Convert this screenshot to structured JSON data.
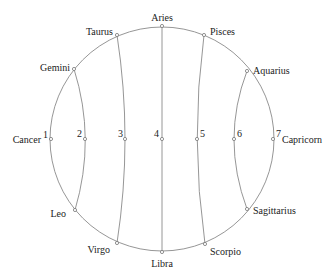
{
  "diagram": {
    "type": "zodiac-circle-arcs",
    "colors": {
      "line": "#8a8a8a",
      "text": "#222222",
      "background": "#ffffff"
    },
    "circle": {
      "cx": 162,
      "cy": 139,
      "r": 113
    },
    "signs": [
      {
        "name": "Aries",
        "x": 162,
        "y": 25
      },
      {
        "name": "Taurus",
        "x": 117,
        "y": 35
      },
      {
        "name": "Gemini",
        "x": 74,
        "y": 69
      },
      {
        "name": "Cancer",
        "x": 51,
        "y": 139
      },
      {
        "name": "Leo",
        "x": 75,
        "y": 210
      },
      {
        "name": "Virgo",
        "x": 117,
        "y": 243
      },
      {
        "name": "Libra",
        "x": 162,
        "y": 253
      },
      {
        "name": "Scorpio",
        "x": 205,
        "y": 244
      },
      {
        "name": "Sagittarius",
        "x": 247,
        "y": 209
      },
      {
        "name": "Capricorn",
        "x": 272,
        "y": 139
      },
      {
        "name": "Aquarius",
        "x": 247,
        "y": 71
      },
      {
        "name": "Pisces",
        "x": 204,
        "y": 35
      }
    ],
    "points": [
      {
        "label": "1",
        "x": 51,
        "y": 139
      },
      {
        "label": "2",
        "x": 85,
        "y": 139
      },
      {
        "label": "3",
        "x": 125,
        "y": 139
      },
      {
        "label": "4",
        "x": 161,
        "y": 139
      },
      {
        "label": "5",
        "x": 197,
        "y": 139
      },
      {
        "label": "6",
        "x": 234,
        "y": 139
      },
      {
        "label": "7",
        "x": 272,
        "y": 139
      }
    ],
    "arcs": [
      {
        "from": "Gemini",
        "through": "2",
        "to": "Leo"
      },
      {
        "from": "Taurus",
        "through": "3",
        "to": "Virgo"
      },
      {
        "from": "Aries",
        "through": "4",
        "to": "Libra"
      },
      {
        "from": "Pisces",
        "through": "5",
        "to": "Scorpio"
      },
      {
        "from": "Aquarius",
        "through": "6",
        "to": "Sagittarius"
      }
    ]
  }
}
